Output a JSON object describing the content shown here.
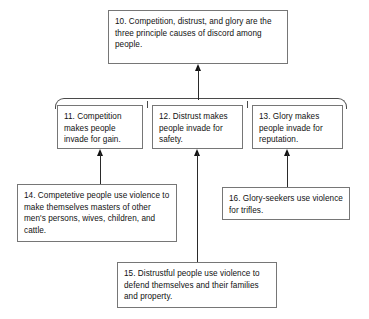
{
  "diagram": {
    "type": "argument-map",
    "colors": {
      "box_border": "#767676",
      "bracket": "#4a4a4a",
      "arrow": "#111111",
      "text": "#111111",
      "background": "#ffffff"
    },
    "nodes": [
      {
        "id": "10",
        "role": "conclusion",
        "text": "10. Competition, distrust, and glory are the three principle causes of discord among people."
      },
      {
        "id": "11",
        "role": "premise",
        "text": "11. Competition makes people invade for gain."
      },
      {
        "id": "12",
        "role": "premise",
        "text": "12. Distrust makes people invade for safety."
      },
      {
        "id": "13",
        "role": "premise",
        "text": "13. Glory makes people invade for reputation."
      },
      {
        "id": "14",
        "role": "support",
        "text": "14. Competetive people use violence to make themselves masters of other men's persons, wives, children, and cattle."
      },
      {
        "id": "15",
        "role": "support",
        "text": "15. Distrustful people use violence to defend themselves and their families and property."
      },
      {
        "id": "16",
        "role": "support",
        "text": "16. Glory-seekers use violence for trifles."
      }
    ],
    "edges": [
      {
        "from": "11,12,13",
        "to": "10",
        "style": "joined-bracket-arrow"
      },
      {
        "from": "14",
        "to": "11",
        "style": "arrow"
      },
      {
        "from": "15",
        "to": "12",
        "style": "arrow"
      },
      {
        "from": "16",
        "to": "13",
        "style": "arrow"
      }
    ]
  }
}
